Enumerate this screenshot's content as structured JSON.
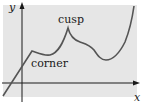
{
  "diagram": {
    "axes": {
      "x_label": "x",
      "y_label": "y"
    },
    "annotations": {
      "cusp": "cusp",
      "corner": "corner"
    },
    "colors": {
      "background": "#e6e6e6",
      "curve": "#555555",
      "axis": "#1a1a1a"
    }
  }
}
